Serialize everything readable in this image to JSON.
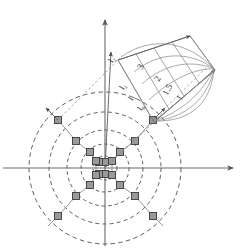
{
  "figure": {
    "type": "scientific-diagram",
    "title": "",
    "background_color": "#ffffff",
    "width": 247,
    "height": 250
  },
  "colors": {
    "axis": "#6b6b6b",
    "node_fill": "#9a9a9a",
    "node_stroke": "#3a3a3a",
    "dashed_circle": "#4a4a4a",
    "lattice_bond": "#8a8a8a",
    "inset_line": "#7d7d7d",
    "curve": "#8e8e8e",
    "label_text": "#2b2b2b"
  },
  "axes": {
    "origin": {
      "x": 105,
      "y": 168
    },
    "horizontal": {
      "name": "x-axis",
      "x1": 3,
      "y1": 168,
      "x2": 238,
      "y2": 168,
      "arrow_at_end": true,
      "arrow_at_start": false
    },
    "vertical": {
      "name": "y-axis",
      "x1": 105,
      "y1": 248,
      "x2": 105,
      "y2": 14,
      "arrow_at_end": true,
      "arrow_at_start": false
    },
    "oblique": {
      "name": "z-axis",
      "x1": 105,
      "y1": 168,
      "x2": 110,
      "y2": 48,
      "arrow_at_end": true,
      "label": "l₂"
    }
  },
  "lattice": {
    "description": "radial lattice of square nodes on concentric shells",
    "node_shape": "square",
    "node_size": 7,
    "nodes": [
      {
        "x": 105,
        "y": 162,
        "shell": 0
      },
      {
        "x": 105,
        "y": 174,
        "shell": 0
      },
      {
        "x": 99,
        "y": 162,
        "shell": 0
      },
      {
        "x": 99,
        "y": 174,
        "shell": 0
      },
      {
        "x": 112,
        "y": 161,
        "shell": 1
      },
      {
        "x": 112,
        "y": 175,
        "shell": 1
      },
      {
        "x": 96,
        "y": 161,
        "shell": 1
      },
      {
        "x": 96,
        "y": 175,
        "shell": 1
      },
      {
        "x": 120,
        "y": 152,
        "shell": 2
      },
      {
        "x": 120,
        "y": 185,
        "shell": 2
      },
      {
        "x": 90,
        "y": 152,
        "shell": 2
      },
      {
        "x": 90,
        "y": 185,
        "shell": 2
      },
      {
        "x": 135,
        "y": 141,
        "shell": 3
      },
      {
        "x": 135,
        "y": 196,
        "shell": 3
      },
      {
        "x": 76,
        "y": 141,
        "shell": 3
      },
      {
        "x": 76,
        "y": 196,
        "shell": 3
      },
      {
        "x": 153,
        "y": 120,
        "shell": 4
      },
      {
        "x": 153,
        "y": 216,
        "shell": 4
      },
      {
        "x": 58,
        "y": 120,
        "shell": 4
      },
      {
        "x": 58,
        "y": 216,
        "shell": 4
      }
    ],
    "shells": [
      {
        "index": 1,
        "radius": 12
      },
      {
        "index": 2,
        "radius": 24
      },
      {
        "index": 3,
        "radius": 38
      },
      {
        "index": 4,
        "radius": 56
      },
      {
        "index": 5,
        "radius": 76
      }
    ]
  },
  "inset": {
    "name": "tilted-cone-panel",
    "description": "tilted parallelogram panel with nested fan of curves converging to apex",
    "rotation_deg": -40,
    "apex": {
      "x": 215,
      "y": 70
    },
    "base": {
      "x": 154,
      "y": 122
    },
    "curve_labels": [
      {
        "text": "3",
        "x": 142,
        "y": 65
      },
      {
        "text": "2",
        "x": 159,
        "y": 77
      },
      {
        "text": "1.5",
        "x": 168,
        "y": 87
      },
      {
        "text": "1",
        "x": 180,
        "y": 96
      }
    ],
    "edge_arrow_labels": [
      "l₂",
      "l₁",
      "l₀"
    ],
    "projection_labels": [
      {
        "text": "l₂",
        "x": 124,
        "y": 87
      },
      {
        "text": "l₁",
        "x": 133,
        "y": 98
      },
      {
        "text": "l₀",
        "x": 141,
        "y": 108
      }
    ]
  },
  "annotations": {
    "axis_tick_label": "l₂"
  }
}
